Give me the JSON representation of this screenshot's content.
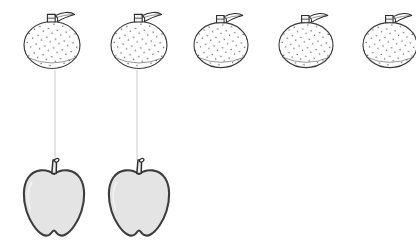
{
  "page": {
    "width": 416,
    "height": 247,
    "background_color": "#ffffff"
  },
  "colors": {
    "background": "#ffffff",
    "outline_dark": "#2e2e2e",
    "outline_orange": "#3a3a3a",
    "apple_fill": "#e4e4e4",
    "apple_outline": "#3d3d3d",
    "orange_fill": "#ffffff",
    "speckle": "#5a5a5a",
    "connector_line": "#cfcfcf",
    "stem_fill": "#f2f2f2"
  },
  "top_row": {
    "name": "tangerine-row",
    "count": 5,
    "fruit_label": "tangerine",
    "center_y": 45,
    "items": [
      {
        "index": 1,
        "label": "tangerine-1",
        "cx": 52,
        "cy": 45,
        "rx": 28,
        "ry": 24,
        "connected": true
      },
      {
        "index": 2,
        "label": "tangerine-2",
        "cx": 139,
        "cy": 45,
        "rx": 28,
        "ry": 24,
        "connected": true
      },
      {
        "index": 3,
        "label": "tangerine-3",
        "cx": 221,
        "cy": 45,
        "rx": 27,
        "ry": 23,
        "connected": false
      },
      {
        "index": 4,
        "label": "tangerine-4",
        "cx": 306,
        "cy": 45,
        "rx": 27,
        "ry": 23,
        "connected": false
      },
      {
        "index": 5,
        "label": "tangerine-5",
        "cx": 390,
        "cy": 45,
        "rx": 27,
        "ry": 23,
        "connected": false
      }
    ]
  },
  "bottom_row": {
    "name": "apple-row",
    "count": 2,
    "fruit_label": "apple",
    "center_y": 204,
    "items": [
      {
        "index": 1,
        "label": "apple-1",
        "cx": 54,
        "cy": 204,
        "rx": 29,
        "ry": 36,
        "connected": true
      },
      {
        "index": 2,
        "label": "apple-2",
        "cx": 139,
        "cy": 204,
        "rx": 29,
        "ry": 36,
        "connected": true
      }
    ]
  },
  "connectors": {
    "name": "matching-lines",
    "count": 2,
    "color": "#cfcfcf",
    "width": 1,
    "items": [
      {
        "index": 1,
        "label": "connector-1",
        "x": 55,
        "y1": 70,
        "y2": 160,
        "from": "tangerine-1",
        "to": "apple-1"
      },
      {
        "index": 2,
        "label": "connector-2",
        "x": 137,
        "y1": 70,
        "y2": 160,
        "from": "tangerine-2",
        "to": "apple-2"
      }
    ]
  },
  "icons": {
    "tangerine": "tangerine-icon",
    "apple": "apple-icon",
    "leaf": "leaf-icon",
    "stem": "stem-icon",
    "connector": "connector-line-icon"
  }
}
